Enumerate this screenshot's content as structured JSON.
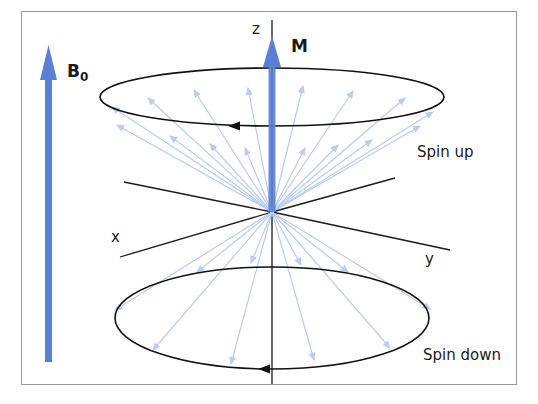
{
  "diagram": {
    "labels": {
      "b0_main": "B",
      "b0_sub": "0",
      "m": "M",
      "z": "z",
      "x": "x",
      "y": "y",
      "spin_up": "Spin up",
      "spin_down": "Spin down"
    },
    "colors": {
      "field_arrow": "#5b7fd6",
      "spin_vectors": "#b9cdf0",
      "axes": "#1a1a1a",
      "frame": "#9a9a9a"
    }
  }
}
